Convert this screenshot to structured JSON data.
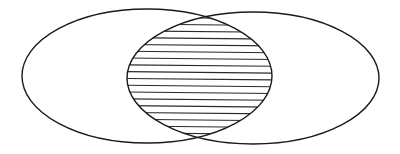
{
  "diagram": {
    "type": "venn",
    "colors": {
      "background": "#ffffff",
      "stroke": "#1a1a1a",
      "hatch": "#2a2a2a"
    },
    "sets": [
      {
        "id": "left-set",
        "cx": 147,
        "cy": 76,
        "rx": 125,
        "ry": 67
      },
      {
        "id": "right-set",
        "cx": 253,
        "cy": 78,
        "rx": 126,
        "ry": 66
      }
    ],
    "intersection": {
      "fill": "horizontal-hatching",
      "hatch_spacing": 6.8,
      "hatch_start_y": 18,
      "hatch_end_y": 136
    }
  }
}
